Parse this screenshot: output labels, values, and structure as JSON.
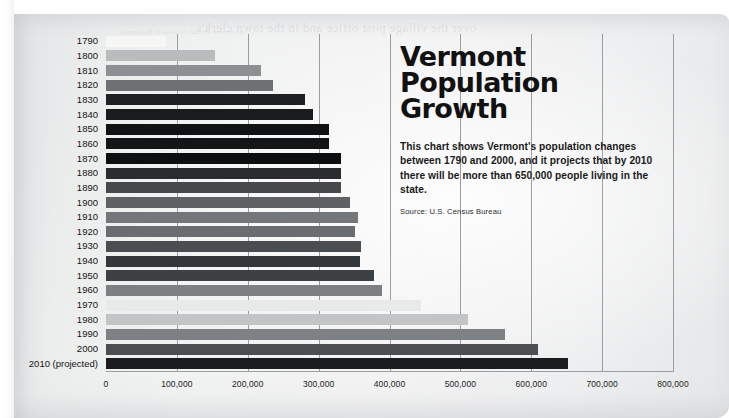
{
  "headline": {
    "title_line1": "Vermont",
    "title_line2": "Population",
    "title_line3": "Growth",
    "deck": "This chart shows Vermont's population changes between 1790 and 2000, and it projects that by 2010 there will be more than 650,000 people living in the state.",
    "source": "Source: U.S. Census Bureau"
  },
  "page": {
    "bleed_text_large": "over the village post office and in the town clerk's",
    "bleed_text_small": "to success of Church Street in Burlington"
  },
  "chart_data": {
    "type": "bar",
    "orientation": "horizontal",
    "title": "Vermont Population Growth",
    "xlabel": "",
    "ylabel": "",
    "xlim": [
      0,
      800000
    ],
    "grid": true,
    "legend": "none",
    "xticks": [
      0,
      100000,
      200000,
      300000,
      400000,
      500000,
      600000,
      700000,
      800000
    ],
    "xticklabels": [
      "0",
      "100,000",
      "200,000",
      "300,000",
      "400,000",
      "500,000",
      "600,000",
      "700,000",
      "800,000"
    ],
    "categories": [
      "1790",
      "1800",
      "1810",
      "1820",
      "1830",
      "1840",
      "1850",
      "1860",
      "1870",
      "1880",
      "1890",
      "1900",
      "1910",
      "1920",
      "1930",
      "1940",
      "1950",
      "1960",
      "1970",
      "1980",
      "1990",
      "2000",
      "2010 (projected)"
    ],
    "values": [
      85000,
      154000,
      218000,
      236000,
      281000,
      292000,
      314000,
      315000,
      331000,
      332000,
      332000,
      344000,
      356000,
      352000,
      360000,
      359000,
      378000,
      390000,
      445000,
      511000,
      563000,
      609000,
      652000
    ],
    "bar_colors": [
      "#f6f6f5",
      "#b9bbbc",
      "#8d9092",
      "#6e7174",
      "#1f2022",
      "#1a1b1d",
      "#111214",
      "#141517",
      "#0d0e10",
      "#2a2c2f",
      "#46484b",
      "#5f6164",
      "#74777a",
      "#6a6d70",
      "#4b4e51",
      "#34373a",
      "#3e4144",
      "#7d8083",
      "#e8e9e9",
      "#c2c4c5",
      "#7e8184",
      "#4c4f52",
      "#1b1c1e"
    ]
  }
}
